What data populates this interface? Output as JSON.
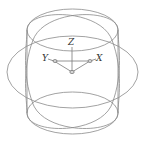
{
  "diagram": {
    "type": "3d-wireframe-orbit",
    "colors": {
      "background": "#ffffff",
      "wire": "#8a8a8a",
      "axis": "#7a7a7a",
      "label": "#333333"
    },
    "ucs_icon": {
      "axes": [
        {
          "name": "Z",
          "label": "Z"
        },
        {
          "name": "Y",
          "label": "Y"
        },
        {
          "name": "X",
          "label": "X"
        }
      ]
    },
    "shapes": [
      "vertical-cylinder",
      "horizontal-ellipse",
      "tilted-ellipse-left",
      "tilted-ellipse-right"
    ]
  }
}
